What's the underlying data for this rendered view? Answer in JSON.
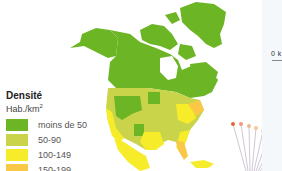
{
  "legend": {
    "title": "Densité",
    "unit_main": "Hab./km",
    "unit_sup": "2",
    "items": [
      {
        "label": "moins de 50",
        "color": "#6cb524"
      },
      {
        "label": "50-90",
        "color": "#c9d44a"
      },
      {
        "label": "100-149",
        "color": "#f6ec2a"
      },
      {
        "label": "150-199",
        "color": "#f8c846"
      }
    ]
  },
  "scale": {
    "label": "0 k"
  },
  "map": {
    "region": "North America",
    "ocean_color": "#ffffff",
    "border_color": "#e8f0c0",
    "callout_dot_colors": [
      "#e8623a",
      "#f09a7a",
      "#f4b888",
      "#f6c890",
      "#f8d898",
      "#f6c890",
      "#f4b888",
      "#f09a7a",
      "#e8623a"
    ]
  }
}
